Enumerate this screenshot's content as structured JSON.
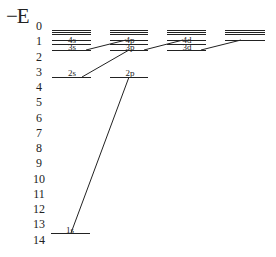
{
  "diagram": {
    "axis_title": "−E",
    "y_ticks": [
      "0",
      "1",
      "2",
      "3",
      "4",
      "5",
      "6",
      "7",
      "8",
      "9",
      "10",
      "11",
      "12",
      "13",
      "14"
    ],
    "colors": {
      "line": "#222222",
      "background": "#ffffff"
    },
    "columns": [
      {
        "id": "s",
        "levels": [
          "1s",
          "2s",
          "3s",
          "4s"
        ]
      },
      {
        "id": "p",
        "levels": [
          "2p",
          "3p",
          "4p"
        ]
      },
      {
        "id": "d",
        "levels": [
          "3d",
          "4d"
        ]
      },
      {
        "id": "f",
        "levels": []
      }
    ],
    "labels": {
      "l1s": "1s",
      "l2s": "2s",
      "l3s": "3s",
      "l4s": "4s",
      "l2p": "2p",
      "l3p": "3p",
      "l4p": "4p",
      "l3d": "3d",
      "l4d": "4d"
    },
    "transitions": [
      [
        "1s",
        "2p"
      ],
      [
        "2s",
        "3p"
      ],
      [
        "3s",
        "4p"
      ],
      [
        "3d",
        "4f"
      ]
    ]
  }
}
